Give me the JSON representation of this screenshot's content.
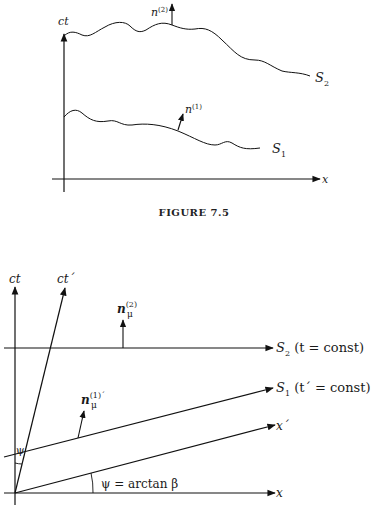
{
  "figure_top": {
    "caption": "FIGURE 7.5",
    "axis_y_label": "ct",
    "axis_x_label": "x",
    "surface_upper_label": "S",
    "surface_upper_sub": "2",
    "surface_lower_label": "S",
    "surface_lower_sub": "1",
    "normal_upper_label": "n",
    "normal_upper_sup": "(2)",
    "normal_lower_label": "n",
    "normal_lower_sup": "(1)"
  },
  "figure_bottom": {
    "axis_ct_label": "ct",
    "axis_ctprime_label": "ct´",
    "axis_x_label": "x",
    "axis_xprime_label": "x´",
    "s2_label": "S",
    "s2_sub": "2",
    "s2_cond": " (t = const)",
    "s1_label": "S",
    "s1_sub": "1",
    "s1_cond": " (t´ = const)",
    "normal_upper_label": "n",
    "normal_upper_sup": "(2)",
    "normal_upper_sub": "μ",
    "normal_lower_label": "n",
    "normal_lower_sup": "(1)´",
    "normal_lower_sub": "μ",
    "angle_label_small": "ψ",
    "angle_formula": "ψ = arctan β"
  }
}
